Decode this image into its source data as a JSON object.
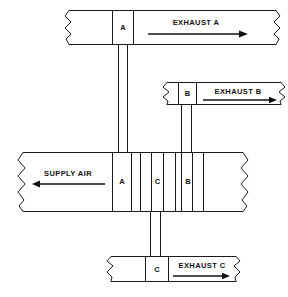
{
  "diagram": {
    "canvas": {
      "width": 288,
      "height": 297
    },
    "ducts": [
      {
        "id": "exhaust-a",
        "orientation": "horizontal",
        "flow_label": "EXHAUST A",
        "flow_direction": "right",
        "damper_label": "A",
        "x": 65,
        "y": 10,
        "width": 215,
        "height": 35
      },
      {
        "id": "exhaust-b",
        "orientation": "horizontal",
        "flow_label": "EXHAUST B",
        "flow_direction": "right",
        "damper_label": "B",
        "x": 163,
        "y": 82,
        "width": 122,
        "height": 23
      },
      {
        "id": "supply-air",
        "orientation": "horizontal",
        "flow_label": "SUPPLY AIR",
        "flow_direction": "left",
        "damper_labels": [
          "A",
          "C",
          "B"
        ],
        "x": 18,
        "y": 152,
        "width": 230,
        "height": 60
      },
      {
        "id": "exhaust-c",
        "orientation": "horizontal",
        "flow_label": "EXHAUST C",
        "flow_direction": "right",
        "damper_label": "C",
        "x": 107,
        "y": 256,
        "width": 133,
        "height": 26
      }
    ],
    "risers": [
      {
        "id": "riser-a",
        "label": "A",
        "x": 118,
        "y": 45,
        "width": 10,
        "height": 107
      },
      {
        "id": "riser-b",
        "label": "B",
        "x": 181,
        "y": 105,
        "width": 11,
        "height": 47
      },
      {
        "id": "riser-c",
        "label": "C",
        "x": 150,
        "y": 212,
        "width": 11,
        "height": 44
      }
    ],
    "labels": {
      "damper_a_top": "A",
      "damper_b_mid": "B",
      "damper_a_supply": "A",
      "damper_c_supply": "C",
      "damper_b_supply": "B",
      "damper_c_bottom": "C",
      "exhaust_a": "EXHAUST A",
      "exhaust_b": "EXHAUST B",
      "exhaust_c": "EXHAUST C",
      "supply_air": "SUPPLY AIR"
    },
    "colors": {
      "line": "#1a1a1a",
      "text": "#111111",
      "background": "#ffffff"
    }
  }
}
